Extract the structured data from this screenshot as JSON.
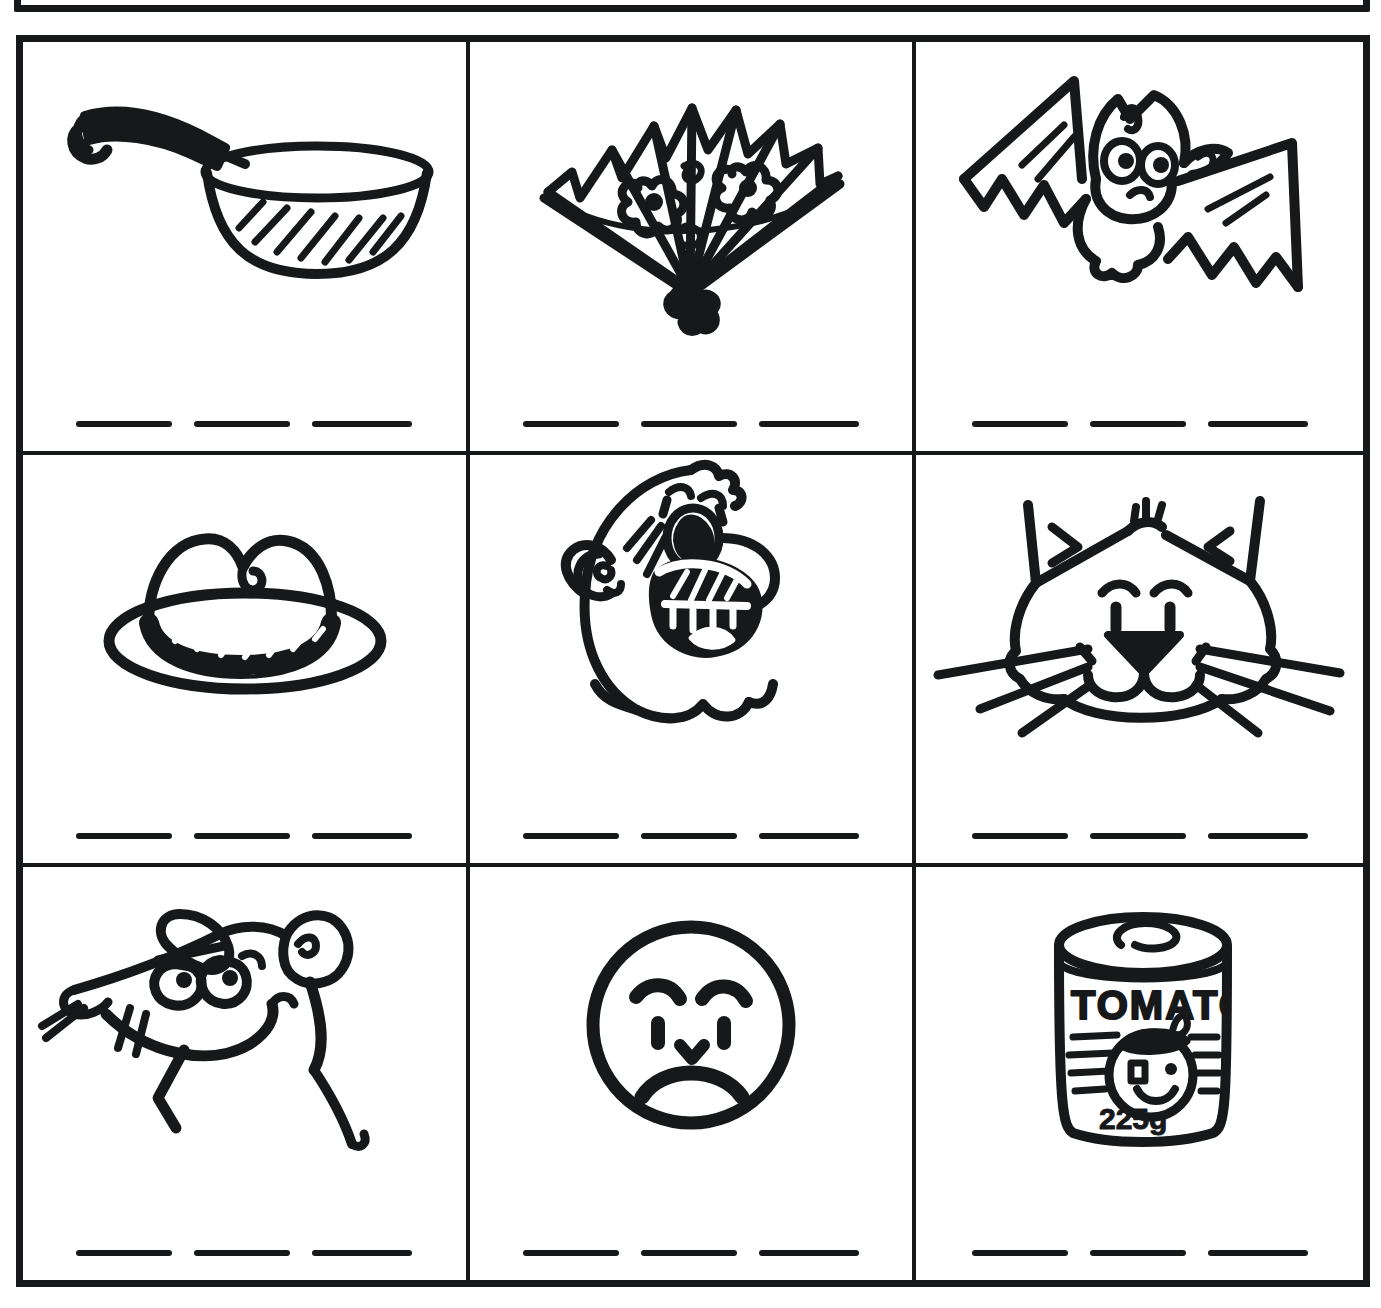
{
  "worksheet": {
    "title": "Picture word exercise grid",
    "grid": {
      "rows": 3,
      "columns": 3
    },
    "ink_color": "#17181a",
    "paper_color": "#ffffff",
    "blank_lines_per_cell": 3,
    "partial_box_above": "bottom edge of previous exercise box"
  },
  "cells": [
    {
      "position": "row1-col1",
      "icon": "saucepan-icon",
      "description": "Saucepan with dark handle and hatched shading",
      "label": "pan",
      "lines": [
        "",
        "",
        ""
      ]
    },
    {
      "position": "row1-col2",
      "icon": "folding-fan-icon",
      "description": "Open folding hand fan decorated with two flowers",
      "label": "fan",
      "lines": [
        "",
        "",
        ""
      ]
    },
    {
      "position": "row1-col3",
      "icon": "bat-icon",
      "description": "Cartoon bat flying with spread scalloped wings",
      "label": "bat",
      "lines": [
        "",
        "",
        ""
      ]
    },
    {
      "position": "row2-col1",
      "icon": "hat-icon",
      "description": "Fedora hat with striped hatband and wide brim",
      "label": "hat",
      "lines": [
        "",
        "",
        ""
      ]
    },
    {
      "position": "row2-col2",
      "icon": "laughing-man-face-icon",
      "description": "Cartoon man's head laughing with big nose and open mouth",
      "label": "man",
      "lines": [
        "",
        "",
        ""
      ]
    },
    {
      "position": "row2-col3",
      "icon": "cat-face-icon",
      "description": "Cat face with pointed ears, triangular nose and long whiskers",
      "label": "cat",
      "lines": [
        "",
        "",
        ""
      ]
    },
    {
      "position": "row3-col1",
      "icon": "rat-icon",
      "description": "Cartoon rat with round ears, whiskers and long tail",
      "label": "rat",
      "lines": [
        "",
        "",
        ""
      ]
    },
    {
      "position": "row3-col2",
      "icon": "sad-face-icon",
      "description": "Round sad face with frowning mouth",
      "label": "sad",
      "lines": [
        "",
        "",
        ""
      ]
    },
    {
      "position": "row3-col3",
      "icon": "tomato-can-icon",
      "description": "Tin can labelled TOMATO with tomato character and weight",
      "label": "can",
      "can_label_text": "TOMATO",
      "can_weight_text": "225g",
      "lines": [
        "",
        "",
        ""
      ]
    }
  ]
}
